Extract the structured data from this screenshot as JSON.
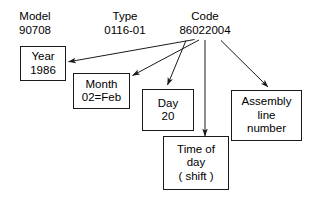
{
  "diagram": {
    "background_color": "#ffffff",
    "stroke_color": "#1a1a1a",
    "text_color": "#000000",
    "headers": [
      {
        "name": "model",
        "label": "Model",
        "value": "90708"
      },
      {
        "name": "type",
        "label": "Type",
        "value": "0116-01"
      },
      {
        "name": "code",
        "label": "Code",
        "value": "86022004"
      }
    ],
    "boxes": [
      {
        "name": "year",
        "lines": [
          "Year",
          "1986"
        ]
      },
      {
        "name": "month",
        "lines": [
          "Month",
          "02=Feb"
        ]
      },
      {
        "name": "day",
        "lines": [
          "Day",
          "20"
        ]
      },
      {
        "name": "time-of-day",
        "lines": [
          "Time of",
          "day",
          "( shift )"
        ]
      },
      {
        "name": "assembly-line",
        "lines": [
          "Assembly",
          "line",
          "number"
        ]
      }
    ],
    "connectors": [
      {
        "name": "code-to-year",
        "from": "code",
        "to": "year"
      },
      {
        "name": "code-to-month",
        "from": "code",
        "to": "month"
      },
      {
        "name": "code-to-day",
        "from": "code",
        "to": "day"
      },
      {
        "name": "code-to-time-of-day",
        "from": "code",
        "to": "time-of-day"
      },
      {
        "name": "code-to-assembly-line",
        "from": "code",
        "to": "assembly-line"
      }
    ]
  }
}
